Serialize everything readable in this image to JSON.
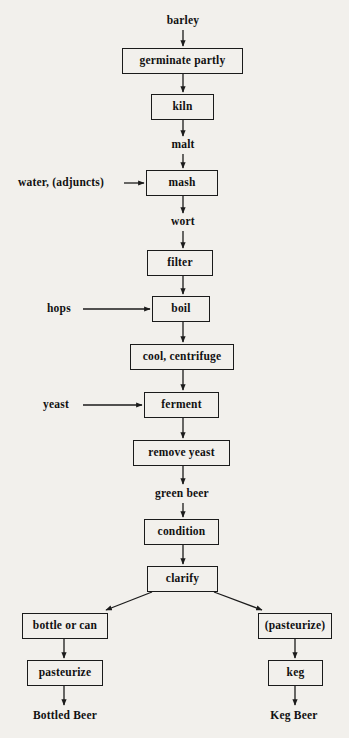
{
  "diagram": {
    "background_color": "#f2f0ec",
    "line_color": "#1b1b1b",
    "text_color": "#111111",
    "nodes": [
      {
        "id": "barley",
        "label": "barley",
        "kind": "text",
        "x": 157,
        "y": 14,
        "w": 52,
        "h": 14
      },
      {
        "id": "germinate_partly",
        "label": "germinate partly",
        "kind": "box",
        "x": 122,
        "y": 48,
        "w": 121,
        "h": 26
      },
      {
        "id": "kiln",
        "label": "kiln",
        "kind": "box",
        "x": 151,
        "y": 94,
        "w": 63,
        "h": 26
      },
      {
        "id": "malt",
        "label": "malt",
        "kind": "text",
        "x": 163,
        "y": 138,
        "w": 40,
        "h": 14
      },
      {
        "id": "water_adjuncts",
        "label": "water, (adjuncts)",
        "kind": "text",
        "x": 18,
        "y": 176,
        "w": 104,
        "h": 14
      },
      {
        "id": "mash",
        "label": "mash",
        "kind": "box",
        "x": 146,
        "y": 170,
        "w": 72,
        "h": 26
      },
      {
        "id": "wort",
        "label": "wort",
        "kind": "text",
        "x": 163,
        "y": 215,
        "w": 40,
        "h": 14
      },
      {
        "id": "filter",
        "label": "filter",
        "kind": "box",
        "x": 147,
        "y": 250,
        "w": 66,
        "h": 26
      },
      {
        "id": "hops",
        "label": "hops",
        "kind": "text",
        "x": 47,
        "y": 302,
        "w": 34,
        "h": 14
      },
      {
        "id": "boil",
        "label": "boil",
        "kind": "box",
        "x": 152,
        "y": 296,
        "w": 58,
        "h": 26
      },
      {
        "id": "cool_centrifuge",
        "label": "cool, centrifuge",
        "kind": "box",
        "x": 130,
        "y": 344,
        "w": 104,
        "h": 26
      },
      {
        "id": "yeast",
        "label": "yeast",
        "kind": "text",
        "x": 43,
        "y": 398,
        "w": 38,
        "h": 14
      },
      {
        "id": "ferment",
        "label": "ferment",
        "kind": "box",
        "x": 144,
        "y": 392,
        "w": 75,
        "h": 26
      },
      {
        "id": "remove_yeast",
        "label": "remove yeast",
        "kind": "box",
        "x": 133,
        "y": 440,
        "w": 97,
        "h": 26
      },
      {
        "id": "green_beer",
        "label": "green beer",
        "kind": "text",
        "x": 150,
        "y": 487,
        "w": 64,
        "h": 14
      },
      {
        "id": "condition",
        "label": "condition",
        "kind": "box",
        "x": 144,
        "y": 519,
        "w": 75,
        "h": 26
      },
      {
        "id": "clarify",
        "label": "clarify",
        "kind": "box",
        "x": 147,
        "y": 566,
        "w": 71,
        "h": 26
      },
      {
        "id": "bottle_or_can",
        "label": "bottle or can",
        "kind": "box",
        "x": 22,
        "y": 613,
        "w": 86,
        "h": 26
      },
      {
        "id": "pasteurize_left",
        "label": "pasteurize",
        "kind": "box",
        "x": 27,
        "y": 660,
        "w": 76,
        "h": 26
      },
      {
        "id": "bottled_beer",
        "label": "Bottled Beer",
        "kind": "text",
        "x": 28,
        "y": 709,
        "w": 74,
        "h": 14
      },
      {
        "id": "pasteurize_right",
        "label": "(pasteurize)",
        "kind": "box",
        "x": 258,
        "y": 613,
        "w": 74,
        "h": 26
      },
      {
        "id": "keg",
        "label": "keg",
        "kind": "box",
        "x": 268,
        "y": 660,
        "w": 55,
        "h": 26
      },
      {
        "id": "keg_beer",
        "label": "Keg Beer",
        "kind": "text",
        "x": 264,
        "y": 709,
        "w": 60,
        "h": 14
      }
    ],
    "edges": [
      {
        "from": "barley",
        "to": "germinate_partly",
        "type": "vertical",
        "x1": 183,
        "y1": 30,
        "x2": 183,
        "y2": 46
      },
      {
        "from": "germinate_partly",
        "to": "kiln",
        "type": "vertical",
        "x1": 183,
        "y1": 74,
        "x2": 183,
        "y2": 92
      },
      {
        "from": "kiln",
        "to": "malt",
        "type": "vertical",
        "x1": 183,
        "y1": 120,
        "x2": 183,
        "y2": 136
      },
      {
        "from": "malt",
        "to": "mash",
        "type": "vertical",
        "x1": 183,
        "y1": 154,
        "x2": 183,
        "y2": 168
      },
      {
        "from": "water_adjuncts",
        "to": "mash",
        "type": "horizontal",
        "x1": 124,
        "y1": 183,
        "x2": 144,
        "y2": 183
      },
      {
        "from": "mash",
        "to": "wort",
        "type": "vertical",
        "x1": 183,
        "y1": 196,
        "x2": 183,
        "y2": 213
      },
      {
        "from": "wort",
        "to": "filter",
        "type": "vertical",
        "x1": 183,
        "y1": 231,
        "x2": 183,
        "y2": 248
      },
      {
        "from": "filter",
        "to": "boil",
        "type": "vertical",
        "x1": 183,
        "y1": 276,
        "x2": 183,
        "y2": 294
      },
      {
        "from": "hops",
        "to": "boil",
        "type": "horizontal",
        "x1": 83,
        "y1": 309,
        "x2": 150,
        "y2": 309
      },
      {
        "from": "boil",
        "to": "cool_centrifuge",
        "type": "vertical",
        "x1": 183,
        "y1": 322,
        "x2": 183,
        "y2": 342
      },
      {
        "from": "cool_centrifuge",
        "to": "ferment",
        "type": "vertical",
        "x1": 183,
        "y1": 370,
        "x2": 183,
        "y2": 390
      },
      {
        "from": "yeast",
        "to": "ferment",
        "type": "horizontal",
        "x1": 83,
        "y1": 405,
        "x2": 142,
        "y2": 405
      },
      {
        "from": "ferment",
        "to": "remove_yeast",
        "type": "vertical",
        "x1": 183,
        "y1": 418,
        "x2": 183,
        "y2": 438
      },
      {
        "from": "remove_yeast",
        "to": "green_beer",
        "type": "vertical",
        "x1": 183,
        "y1": 466,
        "x2": 183,
        "y2": 484
      },
      {
        "from": "green_beer",
        "to": "condition",
        "type": "vertical",
        "x1": 183,
        "y1": 503,
        "x2": 183,
        "y2": 517
      },
      {
        "from": "condition",
        "to": "clarify",
        "type": "vertical",
        "x1": 183,
        "y1": 545,
        "x2": 183,
        "y2": 564
      },
      {
        "from": "clarify",
        "to": "bottle_or_can",
        "type": "diagonal",
        "x1": 152,
        "y1": 592,
        "x2": 106,
        "y2": 610
      },
      {
        "from": "clarify",
        "to": "pasteurize_right",
        "type": "diagonal",
        "x1": 214,
        "y1": 592,
        "x2": 262,
        "y2": 610
      },
      {
        "from": "bottle_or_can",
        "to": "pasteurize_left",
        "type": "vertical",
        "x1": 64,
        "y1": 639,
        "x2": 64,
        "y2": 658
      },
      {
        "from": "pasteurize_left",
        "to": "bottled_beer",
        "type": "vertical",
        "x1": 64,
        "y1": 686,
        "x2": 64,
        "y2": 705
      },
      {
        "from": "pasteurize_right",
        "to": "keg",
        "type": "vertical",
        "x1": 295,
        "y1": 639,
        "x2": 295,
        "y2": 658
      },
      {
        "from": "keg",
        "to": "keg_beer",
        "type": "vertical",
        "x1": 295,
        "y1": 686,
        "x2": 295,
        "y2": 705
      }
    ]
  }
}
